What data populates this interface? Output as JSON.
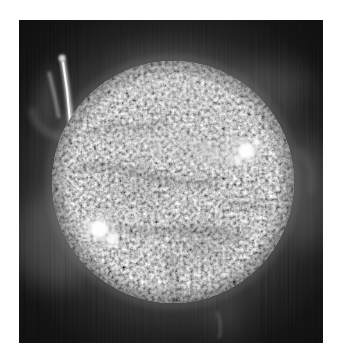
{
  "figure": {
    "style": "black-and-white astronomical photograph on a white page margin"
  },
  "palette": {
    "page_margin": "#ffffff",
    "sky_background": "#0c0c0c",
    "corona_glow": "#3a3a3a",
    "disk_base": "#8e8e8e",
    "disk_dark_lanes": "#2f2f2f",
    "highlight": "#ffffff",
    "prominence": "#e0e0e0"
  },
  "features": [
    {
      "name": "erupting-prominence",
      "position": "upper-left limb"
    },
    {
      "name": "bright-active-region",
      "position": "upper-right of disk"
    },
    {
      "name": "bright-active-region",
      "position": "lower-left of disk"
    },
    {
      "name": "bright-ring-spot",
      "position": "left-center of disk"
    },
    {
      "name": "coronal-glow",
      "position": "surrounding the limb"
    },
    {
      "name": "faint-loop",
      "position": "right limb"
    },
    {
      "name": "faint-wisp",
      "position": "below south limb"
    },
    {
      "name": "mottled-texture",
      "position": "entire disk"
    },
    {
      "name": "vertical-scanline-noise",
      "position": "dark background"
    }
  ]
}
